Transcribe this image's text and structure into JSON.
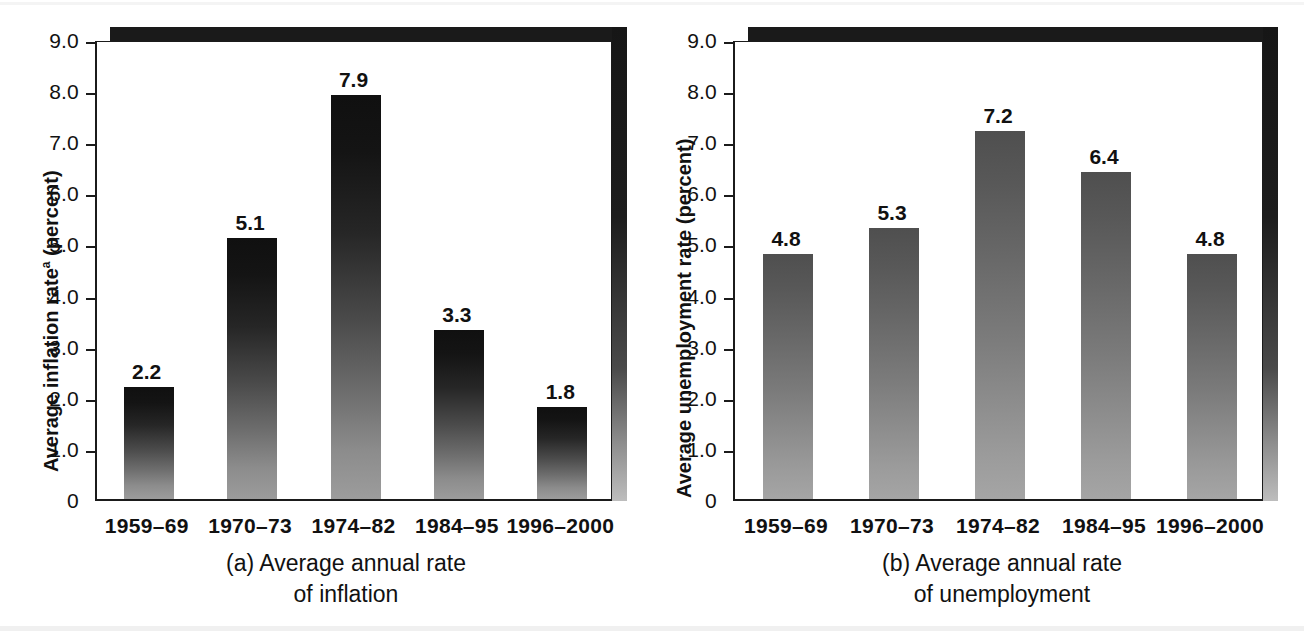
{
  "figure": {
    "panels": [
      {
        "id": "a",
        "caption_line1": "(a) Average annual rate",
        "caption_line2": "of inflation",
        "y_axis_title_main": "Average inflation rate",
        "y_axis_title_sup": "a",
        "y_axis_title_tail": " (percent)"
      },
      {
        "id": "b",
        "caption_line1": "(b) Average annual rate",
        "caption_line2": "of unemployment",
        "y_axis_title_main": "Average unemployment rate",
        "y_axis_title_sup": "",
        "y_axis_title_tail": " (percent)"
      }
    ]
  },
  "chart_data": [
    {
      "type": "bar",
      "title": "(a) Average annual rate of inflation",
      "xlabel": "",
      "ylabel": "Average inflation rateᵃ (percent)",
      "ylim": [
        0,
        9.0
      ],
      "yticks": [
        "0",
        "1.0",
        "2.0",
        "3.0",
        "4.0",
        "5.0",
        "6.0",
        "7.0",
        "8.0",
        "9.0"
      ],
      "ytick_values": [
        0,
        1,
        2,
        3,
        4,
        5,
        6,
        7,
        8,
        9
      ],
      "grid": false,
      "legend": "none",
      "categories": [
        "1959–69",
        "1970–73",
        "1974–82",
        "1984–95",
        "1996–2000"
      ],
      "values": [
        2.2,
        5.1,
        7.9,
        3.3,
        1.8
      ],
      "value_labels": [
        "2.2",
        "5.1",
        "7.9",
        "3.3",
        "1.8"
      ]
    },
    {
      "type": "bar",
      "title": "(b) Average annual rate of unemployment",
      "xlabel": "",
      "ylabel": "Average unemployment rate (percent)",
      "ylim": [
        0,
        9.0
      ],
      "yticks": [
        "0",
        "1.0",
        "2.0",
        "3.0",
        "4.0",
        "5.0",
        "6.0",
        "7.0",
        "8.0",
        "9.0"
      ],
      "ytick_values": [
        0,
        1,
        2,
        3,
        4,
        5,
        6,
        7,
        8,
        9
      ],
      "grid": false,
      "legend": "none",
      "categories": [
        "1959–69",
        "1970–73",
        "1974–82",
        "1984–95",
        "1996–2000"
      ],
      "values": [
        4.8,
        5.3,
        7.2,
        6.4,
        4.8
      ],
      "value_labels": [
        "4.8",
        "5.3",
        "7.2",
        "6.4",
        "4.8"
      ]
    }
  ],
  "colors": {
    "bar_top": "#101010",
    "bar_bottom": "#9c9c9c",
    "axis": "#1b1b1b",
    "shadow": "#1a1a1a",
    "background": "#ffffff"
  }
}
